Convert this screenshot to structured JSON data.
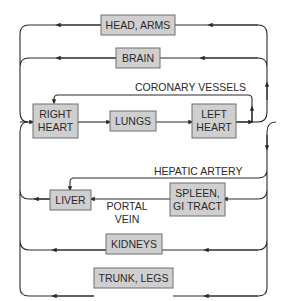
{
  "diagram": {
    "nodes": {
      "head_arms": "HEAD, ARMS",
      "brain": "BRAIN",
      "right_heart_1": "RIGHT",
      "right_heart_2": "HEART",
      "lungs": "LUNGS",
      "left_heart_1": "LEFT",
      "left_heart_2": "HEART",
      "liver": "LIVER",
      "spleen_1": "SPLEEN,",
      "spleen_2": "GI TRACT",
      "kidneys": "KIDNEYS",
      "trunk_legs": "TRUNK, LEGS"
    },
    "labels": {
      "coronary": "CORONARY VESSELS",
      "hepatic": "HEPATIC ARTERY",
      "portal_1": "PORTAL",
      "portal_2": "VEIN"
    },
    "colors": {
      "box_fill": "#cfcfcf",
      "box_stroke": "#6e6e6e",
      "line": "#2a2a2a",
      "background": "#ffffff"
    }
  }
}
